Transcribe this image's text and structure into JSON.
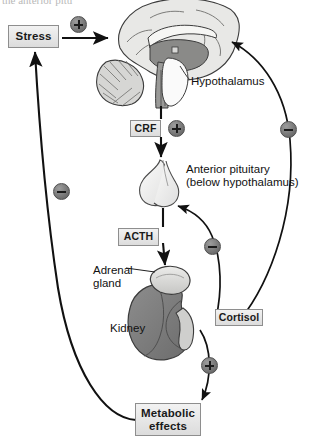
{
  "figure": {
    "title_fragment": "the anterior pitu",
    "type": "physiological-feedback-diagram"
  },
  "nodes": {
    "stress": "Stress",
    "crf": "CRF",
    "acth": "ACTH",
    "cortisol": "Cortisol",
    "metabolic_line1": "Metabolic",
    "metabolic_line2": "effects",
    "hypothalamus": "Hypothalamus",
    "anterior_pituitary_line1": "Anterior pituitary",
    "anterior_pituitary_line2": "(below hypothalamus)",
    "adrenal_line1": "Adrenal",
    "adrenal_line2": "gland",
    "kidney": "Kidney"
  },
  "signs": {
    "stress_to_brain": "+",
    "crf_to_pituitary": "+",
    "cortisol_to_hypothalamus": "−",
    "cortisol_to_pituitary": "−",
    "cortisol_to_metabolic": "+",
    "metabolic_to_stress": "−"
  },
  "anatomy": {
    "brain": "brain-sagittal-illustration",
    "pituitary": "pituitary-gland-illustration",
    "kidney": "kidney-illustration",
    "adrenal": "adrenal-gland-illustration"
  },
  "colors": {
    "box_border": "#8e8e8e",
    "box_fill_top": "#f2f2f2",
    "box_fill_bottom": "#dcdcdc",
    "sign_fill": "#6f6f6f",
    "arrow_stroke": "#111111",
    "brain_light": "#e8e8e6",
    "brain_mid": "#b4b4b2",
    "brain_dark": "#8a8a88",
    "kidney_fill": "#7d7d7d",
    "adrenal_fill": "#d7d7d5"
  }
}
